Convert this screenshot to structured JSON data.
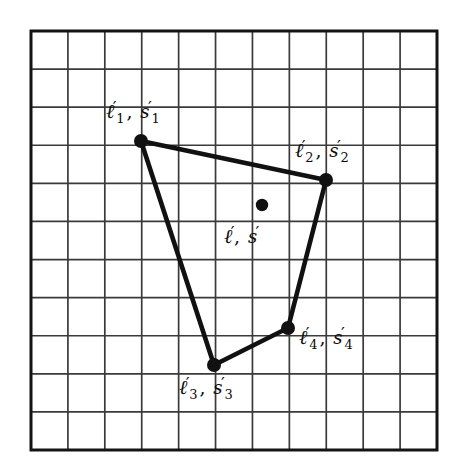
{
  "figure": {
    "background_color": "#ffffff",
    "line_color": "#111111",
    "grid_color": "#3a3a3a",
    "grid": {
      "x0": 31,
      "y0": 31,
      "x1": 437,
      "y1": 450,
      "cols": 11,
      "rows": 11,
      "border_width": 3.0,
      "line_width": 1.7
    },
    "polygon": {
      "name": "quadrilateral",
      "closed": true,
      "stroke_width": 4.6,
      "vertices": [
        {
          "id": "v1",
          "x": 141,
          "y": 141
        },
        {
          "id": "v2",
          "x": 326,
          "y": 180
        },
        {
          "id": "v4",
          "x": 288,
          "y": 328
        },
        {
          "id": "v3",
          "x": 214,
          "y": 365
        }
      ]
    },
    "markers": [
      {
        "id": "v1",
        "x": 141,
        "y": 141,
        "r": 7.0
      },
      {
        "id": "v2",
        "x": 326,
        "y": 180,
        "r": 7.0
      },
      {
        "id": "v4",
        "x": 288,
        "y": 328,
        "r": 7.0
      },
      {
        "id": "v3",
        "x": 214,
        "y": 365,
        "r": 7.0
      },
      {
        "id": "centroid",
        "x": 262,
        "y": 205,
        "r": 6.2
      }
    ],
    "labels": [
      {
        "id": "label-1",
        "for": "v1",
        "ell": "ℓ",
        "ell_sub": "1",
        "ess": "s",
        "ess_sub": "1",
        "prime": "′",
        "comma": ",",
        "text": "ℓ′1, s′1",
        "x": 106,
        "y": 99
      },
      {
        "id": "label-2",
        "for": "v2",
        "ell": "ℓ",
        "ell_sub": "2",
        "ess": "s",
        "ess_sub": "2",
        "prime": "′",
        "comma": ",",
        "text": "ℓ′2, s′2",
        "x": 295,
        "y": 138
      },
      {
        "id": "label-3",
        "for": "v3",
        "ell": "ℓ",
        "ell_sub": "3",
        "ess": "s",
        "ess_sub": "3",
        "prime": "′",
        "comma": ",",
        "text": "ℓ′3, s′3",
        "x": 179,
        "y": 375
      },
      {
        "id": "label-4",
        "for": "v4",
        "ell": "ℓ",
        "ell_sub": "4",
        "ess": "s",
        "ess_sub": "4",
        "prime": "′",
        "comma": ",",
        "text": "ℓ′4, s′4",
        "x": 299,
        "y": 325
      },
      {
        "id": "label-centroid",
        "for": "centroid",
        "ell": "ℓ",
        "ell_sub": "",
        "ess": "s",
        "ess_sub": "",
        "prime": "′",
        "comma": ",",
        "text": "ℓ′, s′",
        "x": 224,
        "y": 224
      }
    ]
  },
  "chart_data": {
    "type": "scatter",
    "title": "",
    "xlabel": "",
    "ylabel": "",
    "grid": true,
    "grid_cols": 11,
    "grid_rows": 11,
    "xlim": [
      0,
      11
    ],
    "ylim": [
      0,
      11
    ],
    "series": [
      {
        "name": "polygon vertices",
        "points": [
          {
            "label": "ℓ′1, s′1",
            "grid_x": 3.0,
            "grid_y": 8.1
          },
          {
            "label": "ℓ′2, s′2",
            "grid_x": 8.0,
            "grid_y": 7.1
          },
          {
            "label": "ℓ′4, s′4",
            "grid_x": 7.0,
            "grid_y": 3.2
          },
          {
            "label": "ℓ′3, s′3",
            "grid_x": 5.0,
            "grid_y": 2.2
          }
        ]
      },
      {
        "name": "interior point",
        "points": [
          {
            "label": "ℓ′, s′",
            "grid_x": 6.3,
            "grid_y": 6.5
          }
        ]
      }
    ]
  }
}
